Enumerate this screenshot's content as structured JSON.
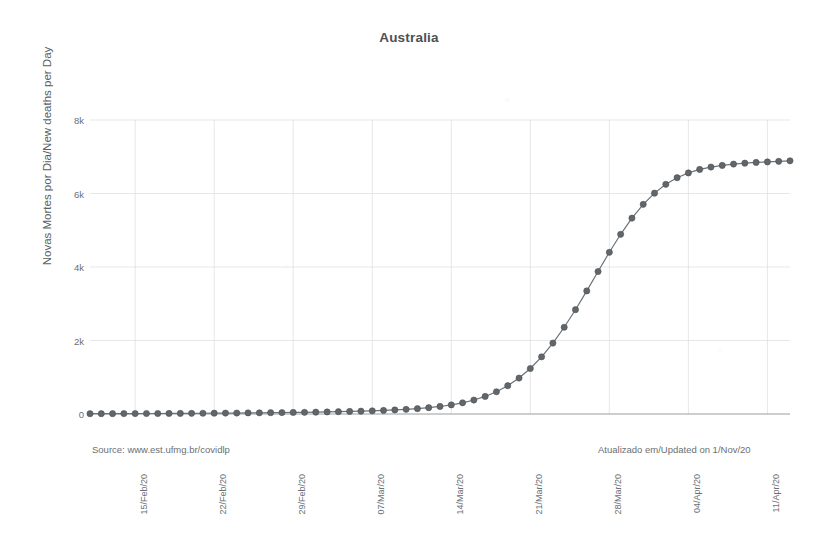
{
  "chart_data": {
    "type": "line",
    "title": "Australia",
    "xlabel": "",
    "ylabel": "Novas Mortes por Dia/New deaths per Day",
    "ylim": [
      0,
      8000
    ],
    "ytick_labels": [
      "0",
      "2k",
      "4k",
      "6k",
      "8k"
    ],
    "ytick_values": [
      0,
      2000,
      4000,
      6000,
      8000
    ],
    "xtick_labels": [
      "15/Feb/20",
      "22/Feb/20",
      "29/Feb/20",
      "07/Mar/20",
      "14/Mar/20",
      "21/Mar/20",
      "28/Mar/20",
      "04/Apr/20",
      "11/Apr/20"
    ],
    "grid": true,
    "legend": "none",
    "marker": "circle",
    "series_color": "#61666a",
    "x": [
      "2020-02-11",
      "2020-02-12",
      "2020-02-13",
      "2020-02-14",
      "2020-02-15",
      "2020-02-16",
      "2020-02-17",
      "2020-02-18",
      "2020-02-19",
      "2020-02-20",
      "2020-02-21",
      "2020-02-22",
      "2020-02-23",
      "2020-02-24",
      "2020-02-25",
      "2020-02-26",
      "2020-02-27",
      "2020-02-28",
      "2020-02-29",
      "2020-03-01",
      "2020-03-02",
      "2020-03-03",
      "2020-03-04",
      "2020-03-05",
      "2020-03-06",
      "2020-03-07",
      "2020-03-08",
      "2020-03-09",
      "2020-03-10",
      "2020-03-11",
      "2020-03-12",
      "2020-03-13",
      "2020-03-14",
      "2020-03-15",
      "2020-03-16",
      "2020-03-17",
      "2020-03-18",
      "2020-03-19",
      "2020-03-20",
      "2020-03-21",
      "2020-03-22",
      "2020-03-23",
      "2020-03-24",
      "2020-03-25",
      "2020-03-26",
      "2020-03-27",
      "2020-03-28",
      "2020-03-29",
      "2020-03-30",
      "2020-03-31",
      "2020-04-01",
      "2020-04-02",
      "2020-04-03",
      "2020-04-04",
      "2020-04-05",
      "2020-04-06",
      "2020-04-07",
      "2020-04-08",
      "2020-04-09",
      "2020-04-10",
      "2020-04-11",
      "2020-04-12",
      "2020-04-13"
    ],
    "values": [
      8,
      9,
      10,
      11,
      12,
      13,
      14,
      15,
      17,
      18,
      20,
      22,
      24,
      26,
      29,
      32,
      35,
      38,
      42,
      46,
      51,
      56,
      62,
      69,
      77,
      86,
      97,
      110,
      126,
      146,
      172,
      205,
      248,
      305,
      380,
      478,
      606,
      770,
      978,
      1238,
      1555,
      1930,
      2360,
      2838,
      3350,
      3878,
      4400,
      4890,
      5330,
      5705,
      6010,
      6250,
      6430,
      6560,
      6655,
      6720,
      6765,
      6800,
      6825,
      6845,
      6860,
      6875,
      6890
    ],
    "series": [
      {
        "name": "Australia cumulative fit",
        "values": [
          8,
          9,
          10,
          11,
          12,
          13,
          14,
          15,
          17,
          18,
          20,
          22,
          24,
          26,
          29,
          32,
          35,
          38,
          42,
          46,
          51,
          56,
          62,
          69,
          77,
          86,
          97,
          110,
          126,
          146,
          172,
          205,
          248,
          305,
          380,
          478,
          606,
          770,
          978,
          1238,
          1555,
          1930,
          2360,
          2838,
          3350,
          3878,
          4400,
          4890,
          5330,
          5705,
          6010,
          6250,
          6430,
          6560,
          6655,
          6720,
          6765,
          6800,
          6825,
          6845,
          6860,
          6875,
          6890
        ]
      }
    ],
    "annotations": {
      "source": "Source: www.est.ufmg.br/covidlp",
      "updated": "Atualizado em/Updated on 1/Nov/20"
    }
  },
  "axis": {
    "y_ticks": [
      {
        "label": "8k",
        "value": 8000
      },
      {
        "label": "6k",
        "value": 6000
      },
      {
        "label": "4k",
        "value": 4000
      },
      {
        "label": "2k",
        "value": 2000
      },
      {
        "label": "0",
        "value": 0
      }
    ],
    "x_ticks": [
      {
        "label": "15/Feb/20",
        "index": 4
      },
      {
        "label": "22/Feb/20",
        "index": 11
      },
      {
        "label": "29/Feb/20",
        "index": 18
      },
      {
        "label": "07/Mar/20",
        "index": 25
      },
      {
        "label": "14/Mar/20",
        "index": 32
      },
      {
        "label": "21/Mar/20",
        "index": 39
      },
      {
        "label": "28/Mar/20",
        "index": 46
      },
      {
        "label": "04/Apr/20",
        "index": 53
      },
      {
        "label": "11/Apr/20",
        "index": 60
      }
    ]
  }
}
